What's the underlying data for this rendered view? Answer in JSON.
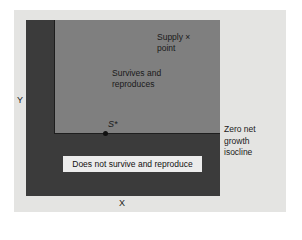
{
  "diagram": {
    "axes": {
      "x_label": "X",
      "y_label": "Y"
    },
    "regions": {
      "survive": {
        "label_line1": "Survives and",
        "label_line2": "reproduces",
        "color": "#7f7f7f"
      },
      "not_survive": {
        "label": "Does not survive and reproduce",
        "color": "#3b3b3b"
      }
    },
    "supply_point": {
      "label_line1": "Supply ×",
      "label_line2": "point"
    },
    "s_star": {
      "label": "S*"
    },
    "isocline": {
      "line1": "Zero net",
      "line2": "growth",
      "line3": "isocline"
    },
    "colors": {
      "background": "#e4e4e2",
      "dark_region": "#3b3b3b",
      "light_region": "#7f7f7f"
    }
  }
}
